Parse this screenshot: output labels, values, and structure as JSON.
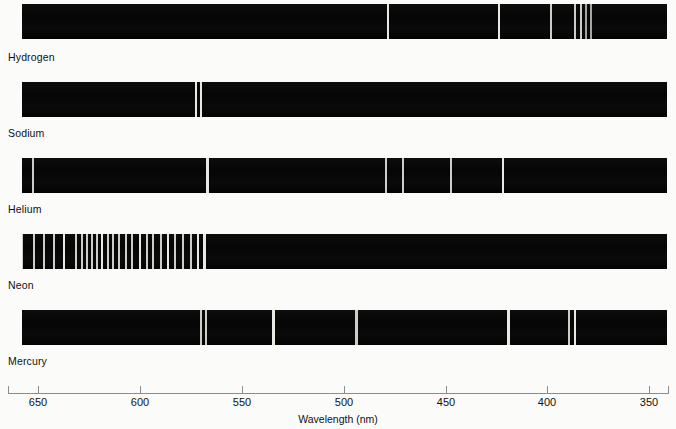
{
  "figure": {
    "background_color": "#fbfbfa",
    "band_color": "#070707",
    "line_color": "#e9e9e4"
  },
  "axis": {
    "title": "Wavelength (nm)",
    "unit": "nm",
    "direction": "decreasing-left-to-right",
    "range_nm": [
      670,
      345
    ],
    "ticks": [
      {
        "label": "650",
        "value_nm": 650,
        "x": 38
      },
      {
        "label": "600",
        "value_nm": 600,
        "x": 140
      },
      {
        "label": "550",
        "value_nm": 550,
        "x": 242
      },
      {
        "label": "500",
        "value_nm": 500,
        "x": 344
      },
      {
        "label": "450",
        "value_nm": 450,
        "x": 446
      },
      {
        "label": "400",
        "value_nm": 400,
        "x": 547
      },
      {
        "label": "350",
        "value_nm": 350,
        "x": 649
      }
    ]
  },
  "spectra": [
    {
      "name": "Hydrogen",
      "label": "Hydrogen",
      "label_x": 8,
      "label_y": 51,
      "band": {
        "x": 22,
        "y": 4,
        "width": 645,
        "height": 35
      },
      "lines": [
        {
          "x": 387,
          "width": 2,
          "wavelength_nm": 486,
          "intensity": "strong"
        },
        {
          "x": 498,
          "width": 2,
          "wavelength_nm": 434,
          "intensity": "strong"
        },
        {
          "x": 550,
          "width": 2,
          "wavelength_nm": 410,
          "intensity": "medium"
        },
        {
          "x": 574,
          "width": 2,
          "wavelength_nm": 397,
          "intensity": "medium"
        },
        {
          "x": 580,
          "width": 2,
          "wavelength_nm": 394,
          "intensity": "medium"
        },
        {
          "x": 585,
          "width": 2,
          "wavelength_nm": 391,
          "intensity": "weak"
        },
        {
          "x": 590,
          "width": 2,
          "wavelength_nm": 389,
          "intensity": "weak"
        }
      ]
    },
    {
      "name": "Sodium",
      "label": "Sodium",
      "label_x": 8,
      "label_y": 127,
      "band": {
        "x": 22,
        "y": 82,
        "width": 645,
        "height": 35
      },
      "lines": [
        {
          "x": 195,
          "width": 2,
          "wavelength_nm": 589.6,
          "intensity": "strong"
        },
        {
          "x": 200,
          "width": 2,
          "wavelength_nm": 589.0,
          "intensity": "strong"
        }
      ]
    },
    {
      "name": "Helium",
      "label": "Helium",
      "label_x": 8,
      "label_y": 203,
      "band": {
        "x": 22,
        "y": 158,
        "width": 645,
        "height": 35
      },
      "lines": [
        {
          "x": 32,
          "width": 2,
          "wavelength_nm": 668,
          "intensity": "medium"
        },
        {
          "x": 206,
          "width": 3,
          "wavelength_nm": 588,
          "intensity": "strong"
        },
        {
          "x": 385,
          "width": 2,
          "wavelength_nm": 502,
          "intensity": "medium"
        },
        {
          "x": 402,
          "width": 2,
          "wavelength_nm": 492,
          "intensity": "medium"
        },
        {
          "x": 450,
          "width": 2,
          "wavelength_nm": 471,
          "intensity": "medium"
        },
        {
          "x": 502,
          "width": 2,
          "wavelength_nm": 447,
          "intensity": "strong"
        }
      ]
    },
    {
      "name": "Neon",
      "label": "Neon",
      "label_x": 8,
      "label_y": 279,
      "band": {
        "x": 22,
        "y": 234,
        "width": 645,
        "height": 35
      },
      "lines": [
        {
          "x": 21,
          "width": 2,
          "wavelength_nm": 671,
          "intensity": "medium"
        },
        {
          "x": 33,
          "width": 2,
          "wavelength_nm": 665,
          "intensity": "medium"
        },
        {
          "x": 43,
          "width": 2,
          "wavelength_nm": 660,
          "intensity": "medium"
        },
        {
          "x": 53,
          "width": 2,
          "wavelength_nm": 655,
          "intensity": "medium"
        },
        {
          "x": 63,
          "width": 2,
          "wavelength_nm": 650,
          "intensity": "strong"
        },
        {
          "x": 75,
          "width": 2,
          "wavelength_nm": 644,
          "intensity": "medium"
        },
        {
          "x": 81,
          "width": 2,
          "wavelength_nm": 641,
          "intensity": "medium"
        },
        {
          "x": 86,
          "width": 2,
          "wavelength_nm": 638,
          "intensity": "medium"
        },
        {
          "x": 91,
          "width": 2,
          "wavelength_nm": 636,
          "intensity": "medium"
        },
        {
          "x": 96,
          "width": 2,
          "wavelength_nm": 633,
          "intensity": "medium"
        },
        {
          "x": 101,
          "width": 2,
          "wavelength_nm": 631,
          "intensity": "strong"
        },
        {
          "x": 107,
          "width": 2,
          "wavelength_nm": 628,
          "intensity": "medium"
        },
        {
          "x": 112,
          "width": 2,
          "wavelength_nm": 626,
          "intensity": "medium"
        },
        {
          "x": 118,
          "width": 2,
          "wavelength_nm": 623,
          "intensity": "medium"
        },
        {
          "x": 125,
          "width": 2,
          "wavelength_nm": 620,
          "intensity": "medium"
        },
        {
          "x": 131,
          "width": 2,
          "wavelength_nm": 617,
          "intensity": "medium"
        },
        {
          "x": 139,
          "width": 2,
          "wavelength_nm": 613,
          "intensity": "strong"
        },
        {
          "x": 146,
          "width": 2,
          "wavelength_nm": 610,
          "intensity": "medium"
        },
        {
          "x": 152,
          "width": 2,
          "wavelength_nm": 607,
          "intensity": "medium"
        },
        {
          "x": 160,
          "width": 2,
          "wavelength_nm": 603,
          "intensity": "medium"
        },
        {
          "x": 167,
          "width": 2,
          "wavelength_nm": 600,
          "intensity": "strong"
        },
        {
          "x": 174,
          "width": 2,
          "wavelength_nm": 597,
          "intensity": "medium"
        },
        {
          "x": 182,
          "width": 2,
          "wavelength_nm": 593,
          "intensity": "medium"
        },
        {
          "x": 190,
          "width": 2,
          "wavelength_nm": 589,
          "intensity": "medium"
        },
        {
          "x": 197,
          "width": 2,
          "wavelength_nm": 585,
          "intensity": "strong"
        },
        {
          "x": 203,
          "width": 3,
          "wavelength_nm": 582,
          "intensity": "strong"
        }
      ]
    },
    {
      "name": "Mercury",
      "label": "Mercury",
      "label_x": 8,
      "label_y": 355,
      "band": {
        "x": 22,
        "y": 310,
        "width": 645,
        "height": 35
      },
      "lines": [
        {
          "x": 200,
          "width": 2,
          "wavelength_nm": 590,
          "intensity": "medium"
        },
        {
          "x": 205,
          "width": 2,
          "wavelength_nm": 588,
          "intensity": "medium"
        },
        {
          "x": 272,
          "width": 3,
          "wavelength_nm": 546,
          "intensity": "strong"
        },
        {
          "x": 355,
          "width": 3,
          "wavelength_nm": 496,
          "intensity": "medium"
        },
        {
          "x": 507,
          "width": 3,
          "wavelength_nm": 435,
          "intensity": "strong"
        },
        {
          "x": 568,
          "width": 2,
          "wavelength_nm": 405,
          "intensity": "medium"
        },
        {
          "x": 574,
          "width": 2,
          "wavelength_nm": 404,
          "intensity": "strong"
        }
      ]
    }
  ]
}
